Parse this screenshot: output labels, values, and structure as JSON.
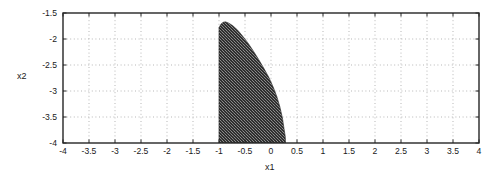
{
  "figure": {
    "background_color": "#ffffff",
    "frame_color": "#262626",
    "grid_color": "#9a9a9a",
    "region_fill_color": "#3b3b3b",
    "text_color": "#1a1a1a"
  },
  "axes": {
    "x_label": "x1",
    "y_label": "x2"
  },
  "chart_data": {
    "type": "area",
    "title": "",
    "xlabel": "x1",
    "ylabel": "x2",
    "xlim": [
      -4,
      4
    ],
    "ylim": [
      -4,
      -1.5
    ],
    "grid": true,
    "legend": null,
    "x_ticks": [
      -4,
      -3.5,
      -3,
      -2.5,
      -2,
      -1.5,
      -1,
      -0.5,
      0,
      0.5,
      1,
      1.5,
      2,
      2.5,
      3,
      3.5,
      4
    ],
    "x_tick_labels": [
      "-4",
      "-3.5",
      "-3",
      "-2.5",
      "-2",
      "-1.5",
      "-1",
      "-0.5",
      "0",
      "0.5",
      "1",
      "1.5",
      "2",
      "2.5",
      "3",
      "3.5",
      "4"
    ],
    "y_ticks": [
      -4,
      -3.5,
      -3,
      -2.5,
      -2,
      -1.5
    ],
    "y_tick_labels": [
      "-4",
      "-3.5",
      "-3",
      "-2.5",
      "-2",
      "-1.5"
    ],
    "series": [
      {
        "name": "feasible region",
        "kind": "filled-region",
        "fill": "#3b3b3b",
        "texture": "stippled",
        "description": "Shaded region bounded on the left by the vertical line x1 = -1, on the bottom by x2 = -4, and on the right by a curve rising from (0.28, -4) to an apex near (-0.88, -1.67).",
        "left_boundary_x": -1.0,
        "apex": [
          -0.88,
          -1.67
        ],
        "bottom_right_x": 0.28,
        "boundary_points": [
          [
            -1.0,
            -4.0
          ],
          [
            -1.0,
            -3.5
          ],
          [
            -1.0,
            -3.0
          ],
          [
            -1.0,
            -2.5
          ],
          [
            -1.0,
            -2.0
          ],
          [
            -1.0,
            -1.78
          ],
          [
            -0.96,
            -1.71
          ],
          [
            -0.92,
            -1.68
          ],
          [
            -0.88,
            -1.67
          ],
          [
            -0.82,
            -1.69
          ],
          [
            -0.74,
            -1.74
          ],
          [
            -0.64,
            -1.83
          ],
          [
            -0.54,
            -1.95
          ],
          [
            -0.44,
            -2.08
          ],
          [
            -0.34,
            -2.23
          ],
          [
            -0.24,
            -2.39
          ],
          [
            -0.14,
            -2.56
          ],
          [
            -0.04,
            -2.74
          ],
          [
            0.04,
            -2.92
          ],
          [
            0.11,
            -3.1
          ],
          [
            0.17,
            -3.3
          ],
          [
            0.22,
            -3.52
          ],
          [
            0.25,
            -3.72
          ],
          [
            0.275,
            -3.88
          ],
          [
            0.28,
            -4.0
          ]
        ]
      }
    ]
  }
}
